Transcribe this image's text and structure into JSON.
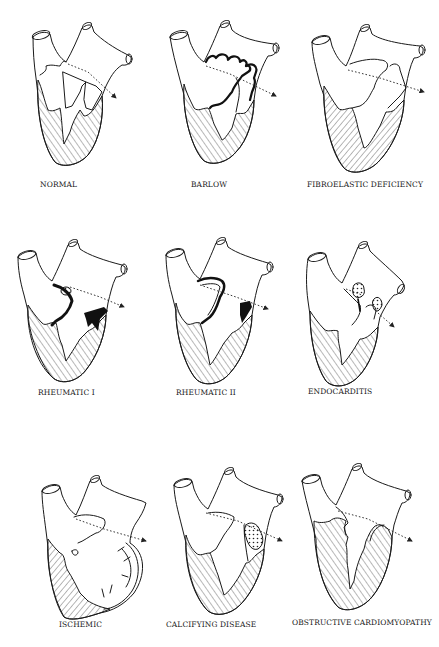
{
  "figure": {
    "panels": [
      {
        "id": "normal",
        "label": "NORMAL"
      },
      {
        "id": "barlow",
        "label": "BARLOW"
      },
      {
        "id": "fibroelastic",
        "label": "FIBROELASTIC DEFICIENCY"
      },
      {
        "id": "rheumatic1",
        "label": "RHEUMATIC I"
      },
      {
        "id": "rheumatic2",
        "label": "RHEUMATIC II"
      },
      {
        "id": "endocarditis",
        "label": "ENDOCARDITIS"
      },
      {
        "id": "ischemic",
        "label": "ISCHEMIC"
      },
      {
        "id": "calcifying",
        "label": "CALCIFYING DISEASE"
      },
      {
        "id": "obstructive",
        "label": "OBSTRUCTIVE CARDIOMYOPATHY"
      }
    ]
  }
}
